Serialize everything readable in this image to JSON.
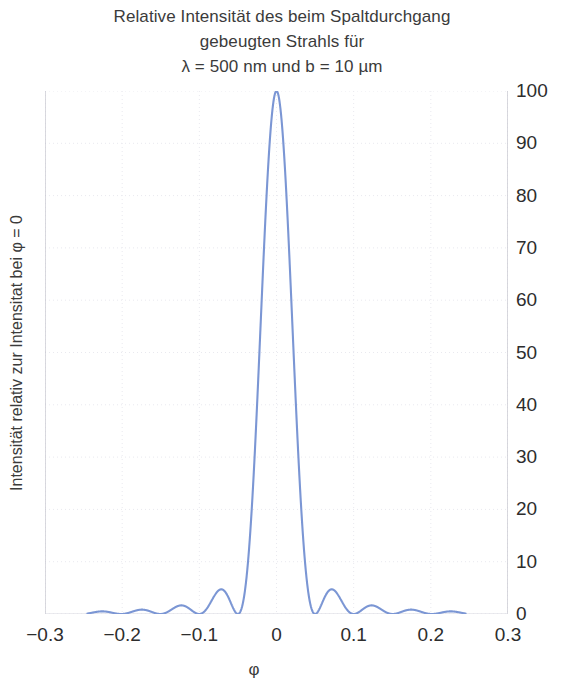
{
  "figure": {
    "title_lines": [
      "Relative Intensität des beim Spaltdurchgang",
      "gebeugten Strahls für",
      "λ = 500 nm und b = 10 µm"
    ],
    "ylabel": "Intensität relativ zur Intensitat bei φ = 0",
    "xlabel": "φ",
    "line_color": "#7b96d4",
    "grid_color": "#e9e9ef",
    "axis_color": "#b9b9c4",
    "text_color": "#3b3b3b"
  },
  "chart_data": {
    "type": "line",
    "title": "Relative Intensität des beim Spaltdurchgang gebeugten Strahls für λ = 500 nm und b = 10 µm",
    "xlabel": "φ",
    "ylabel": "Intensität relativ zur Intensitat bei φ = 0",
    "xlim": [
      -0.3,
      0.3
    ],
    "ylim": [
      0,
      100
    ],
    "xticks": [
      -0.3,
      -0.2,
      -0.1,
      0,
      0.1,
      0.2,
      0.3
    ],
    "xticklabels": [
      "−0.3",
      "−0.2",
      "−0.1",
      "0",
      "0.1",
      "0.2",
      "0.3"
    ],
    "yticks": [
      0,
      10,
      20,
      30,
      40,
      50,
      60,
      70,
      80,
      90,
      100
    ],
    "yticklabels": [
      "0",
      "10",
      "20",
      "30",
      "40",
      "50",
      "60",
      "70",
      "80",
      "90",
      "100"
    ],
    "ytick_side": "right",
    "grid": true,
    "legend": false,
    "series": [
      {
        "name": "sinc^2 Beugungsintensität",
        "color": "#7b96d4",
        "formula": "I/I0 = (sin(pi*b*sin(phi)/lambda) / (pi*b*sin(phi)/lambda))^2",
        "parameters": {
          "lambda_nm": 500,
          "b_um": 10,
          "ratio_b_over_lambda": 20
        },
        "x_range": [
          -0.245,
          0.245
        ],
        "zeros": [
          -0.25,
          -0.2,
          -0.15,
          -0.1,
          -0.05,
          0.05,
          0.1,
          0.15,
          0.2,
          0.25
        ],
        "peaks": [
          {
            "x": 0.0,
            "y": 100.0
          },
          {
            "x": 0.0715,
            "y": 4.7
          },
          {
            "x": 0.1225,
            "y": 1.65
          },
          {
            "x": 0.1729,
            "y": 0.83
          },
          {
            "x": 0.2232,
            "y": 0.5
          },
          {
            "x": -0.0715,
            "y": 4.7
          },
          {
            "x": -0.1225,
            "y": 1.65
          },
          {
            "x": -0.1729,
            "y": 0.83
          },
          {
            "x": -0.2232,
            "y": 0.5
          }
        ]
      }
    ]
  }
}
